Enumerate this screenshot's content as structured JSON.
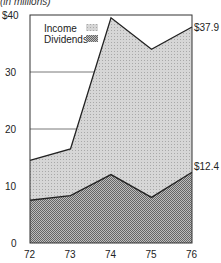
{
  "chart_data": {
    "type": "area",
    "subtitle": "(in millions)",
    "x": [
      "72",
      "73",
      "74",
      "75",
      "76"
    ],
    "series": [
      {
        "name": "Income",
        "values": [
          14.5,
          16.5,
          39.5,
          34.0,
          37.9
        ],
        "end_label": "$37.9"
      },
      {
        "name": "Dividends",
        "values": [
          7.5,
          8.3,
          12.0,
          8.0,
          12.4
        ],
        "end_label": "$12.4"
      }
    ],
    "yticks": [
      "0",
      "10",
      "20",
      "30",
      "$40"
    ],
    "ylim": [
      0,
      40
    ],
    "grid": true,
    "legend_position": "top-left inside",
    "colors": {
      "income_fill": "#c8c8c8",
      "dividends_fill": "#9a9a9a",
      "line": "#222222"
    }
  }
}
